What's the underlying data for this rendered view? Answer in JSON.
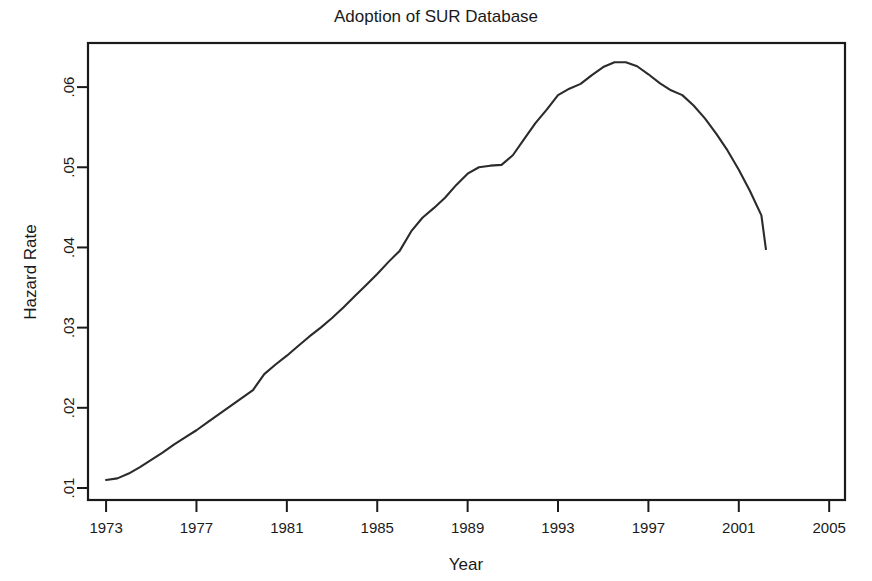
{
  "chart_data": {
    "type": "line",
    "title": "Adoption of SUR Database",
    "xlabel": "Year",
    "ylabel": "Hazard Rate",
    "xlim": [
      1972.2,
      2005.7
    ],
    "ylim": [
      0.0085,
      0.0655
    ],
    "grid": false,
    "legend": null,
    "xticks": [
      1973,
      1977,
      1981,
      1985,
      1989,
      1993,
      1997,
      2001,
      2005
    ],
    "xtick_labels": [
      "1973",
      "1977",
      "1981",
      "1985",
      "1989",
      "1993",
      "1997",
      "2001",
      "2005"
    ],
    "yticks": [
      0.01,
      0.02,
      0.03,
      0.04,
      0.05,
      0.06
    ],
    "ytick_labels": [
      ".01",
      ".02",
      ".03",
      ".04",
      ".05",
      ".06"
    ],
    "series": [
      {
        "name": "Hazard Rate",
        "color": "#2b2b2b",
        "x": [
          1973.0,
          1973.5,
          1974.0,
          1974.5,
          1975.0,
          1975.5,
          1976.0,
          1976.5,
          1977.0,
          1977.5,
          1978.0,
          1978.5,
          1979.0,
          1979.5,
          1980.0,
          1980.5,
          1981.0,
          1981.5,
          1982.0,
          1982.5,
          1983.0,
          1983.5,
          1984.0,
          1984.5,
          1985.0,
          1985.5,
          1986.0,
          1986.5,
          1987.0,
          1987.5,
          1988.0,
          1988.5,
          1989.0,
          1989.5,
          1990.0,
          1990.5,
          1991.0,
          1991.5,
          1992.0,
          1992.5,
          1993.0,
          1993.5,
          1994.0,
          1994.5,
          1995.0,
          1995.5,
          1996.0,
          1996.5,
          1997.0,
          1997.5,
          1998.0,
          1998.5,
          1999.0,
          1999.5,
          2000.0,
          2000.5,
          2001.0,
          2001.5,
          2002.0,
          2002.2
        ],
        "y": [
          0.011,
          0.0112,
          0.0118,
          0.0126,
          0.0135,
          0.0144,
          0.0154,
          0.0163,
          0.0172,
          0.0182,
          0.0192,
          0.0202,
          0.0212,
          0.0222,
          0.0242,
          0.0254,
          0.0265,
          0.0277,
          0.0289,
          0.03,
          0.0312,
          0.0325,
          0.0339,
          0.0353,
          0.0367,
          0.0382,
          0.0396,
          0.042,
          0.0437,
          0.0449,
          0.0462,
          0.0478,
          0.0492,
          0.05,
          0.0502,
          0.0503,
          0.0515,
          0.0535,
          0.0555,
          0.0572,
          0.059,
          0.0598,
          0.0604,
          0.0615,
          0.0625,
          0.0631,
          0.0631,
          0.0626,
          0.0616,
          0.0605,
          0.0596,
          0.059,
          0.0577,
          0.0561,
          0.0542,
          0.0521,
          0.0497,
          0.047,
          0.044,
          0.0398
        ]
      }
    ]
  },
  "figure": {
    "title": "Adoption of SUR Database",
    "xlabel": "Year",
    "ylabel": "Hazard Rate",
    "line_color": "#2b2b2b",
    "axis_color": "#1a1a1a",
    "background": "#ffffff"
  }
}
